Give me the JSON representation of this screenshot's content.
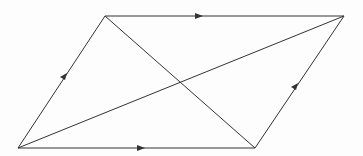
{
  "diagram": {
    "type": "parallelogram-with-diagonals",
    "colors": {
      "stroke": "#333333",
      "background": "#fdfdfd"
    },
    "vertices": {
      "bottom_left": [
        18,
        148
      ],
      "top_left": [
        105,
        16
      ],
      "top_right": [
        344,
        16
      ],
      "bottom_right": [
        255,
        148
      ]
    },
    "arrows": [
      "top-edge-right",
      "bottom-edge-right",
      "left-edge-up",
      "right-edge-up"
    ]
  }
}
